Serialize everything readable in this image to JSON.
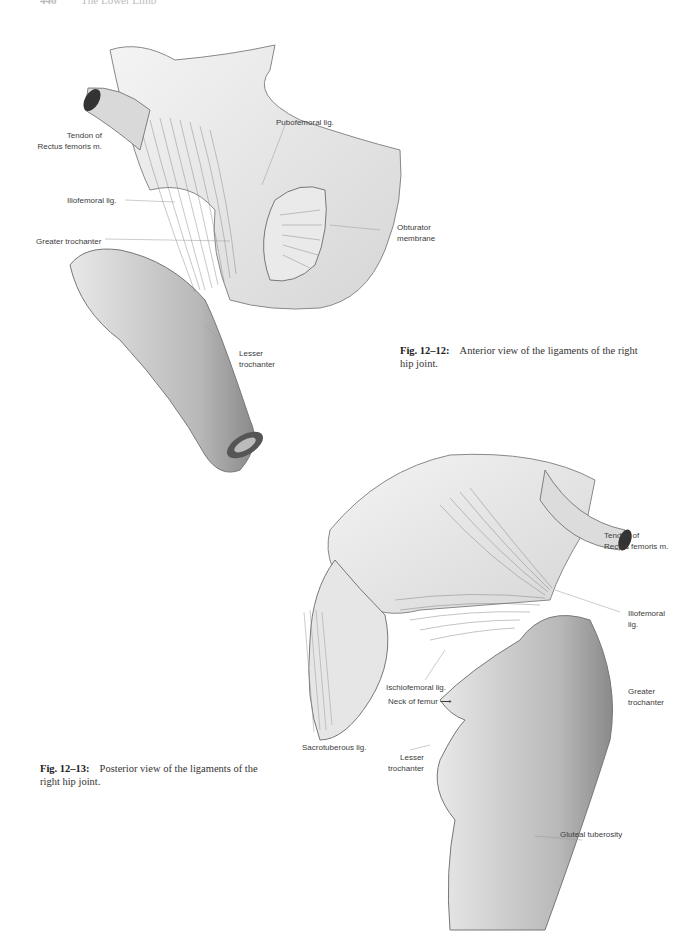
{
  "running_head": {
    "page_number": "446",
    "section": "The Lower Limb"
  },
  "figures": [
    {
      "id": "fig-12-12",
      "caption": {
        "label": "Fig. 12–12:",
        "text": "Anterior view of the ligaments of the right hip joint."
      },
      "labels": {
        "tendon_rectus": "Tendon of\nRectus femoris m.",
        "pubofemoral": "Pubofemoral lig.",
        "iliofemoral": "Iliofemoral lig.",
        "greater_trochanter": "Greater trochanter",
        "obturator": "Obturator\nmembrane",
        "lesser_trochanter": "Lesser\ntrochanter"
      }
    },
    {
      "id": "fig-12-13",
      "caption": {
        "label": "Fig. 12–13:",
        "text": "Posterior view of the ligaments of the right hip joint."
      },
      "labels": {
        "tendon_rectus": "Tendon of\nRectus femoris m.",
        "iliofemoral": "Iliofemoral\nlig.",
        "ischiofemoral": "Ischiofemoral lig.",
        "neck_of_femur": "Neck of femur ⟶",
        "greater_trochanter": "Greater\ntrochanter",
        "sacrotuberous": "Sacrotuberous lig.",
        "lesser_trochanter": "Lesser\ntrochanter",
        "gluteal_tuberosity": "Gluteal tuberosity"
      }
    }
  ]
}
